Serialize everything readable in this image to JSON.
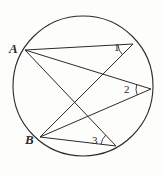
{
  "figure": {
    "background_color": "#fdfdfc",
    "stroke_color": "#2b2b2b",
    "label_color": "#2b2b2b"
  },
  "circle": {
    "name": "main-circle",
    "center_x": 83,
    "center_y": 86,
    "radius": 70
  },
  "points": {
    "A": {
      "label": "A",
      "x": 25,
      "y": 50
    },
    "B": {
      "label": "B",
      "x": 40,
      "y": 137
    },
    "V1": {
      "label": "1",
      "x": 133,
      "y": 44
    },
    "V2": {
      "label": "2",
      "x": 151,
      "y": 89
    },
    "V3": {
      "label": "3",
      "x": 116,
      "y": 146
    }
  },
  "chords": [
    {
      "name": "chord-A-V1",
      "from": "A",
      "to": "V1"
    },
    {
      "name": "chord-A-V2",
      "from": "A",
      "to": "V2"
    },
    {
      "name": "chord-A-V3",
      "from": "A",
      "to": "V3"
    },
    {
      "name": "chord-B-V1",
      "from": "B",
      "to": "V1"
    },
    {
      "name": "chord-B-V2",
      "from": "B",
      "to": "V2"
    },
    {
      "name": "chord-B-V3",
      "from": "B",
      "to": "V3"
    }
  ],
  "angle_marks": [
    {
      "name": "angle-arc-1",
      "at": "V1",
      "label": "1"
    },
    {
      "name": "angle-arc-2",
      "at": "V2",
      "label": "2"
    },
    {
      "name": "angle-arc-3",
      "at": "V3",
      "label": "3"
    }
  ],
  "labels": {
    "point_a": "A",
    "point_b": "B",
    "angle_one": "1",
    "angle_two": "2",
    "angle_three": "3"
  }
}
